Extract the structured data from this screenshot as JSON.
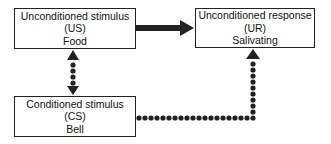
{
  "diagram": {
    "nodes": [
      {
        "id": "us",
        "title": "Unconditioned stimulus",
        "abbr": "(US)",
        "example": "Food"
      },
      {
        "id": "ur",
        "title": "Unconditioned response",
        "abbr": "(UR)",
        "example": "Salivating"
      },
      {
        "id": "cs",
        "title": "Conditioned stimulus",
        "abbr": "(CS)",
        "example": "Bell"
      }
    ],
    "edges": [
      {
        "from": "us",
        "to": "ur",
        "style": "solid-thick-arrow"
      },
      {
        "from": "us",
        "to": "cs",
        "style": "dotted-double-arrow"
      },
      {
        "from": "cs",
        "to": "ur",
        "style": "dotted-elbow-arrow"
      }
    ],
    "colors": {
      "line": "#222222",
      "background": "#ffffff"
    }
  }
}
